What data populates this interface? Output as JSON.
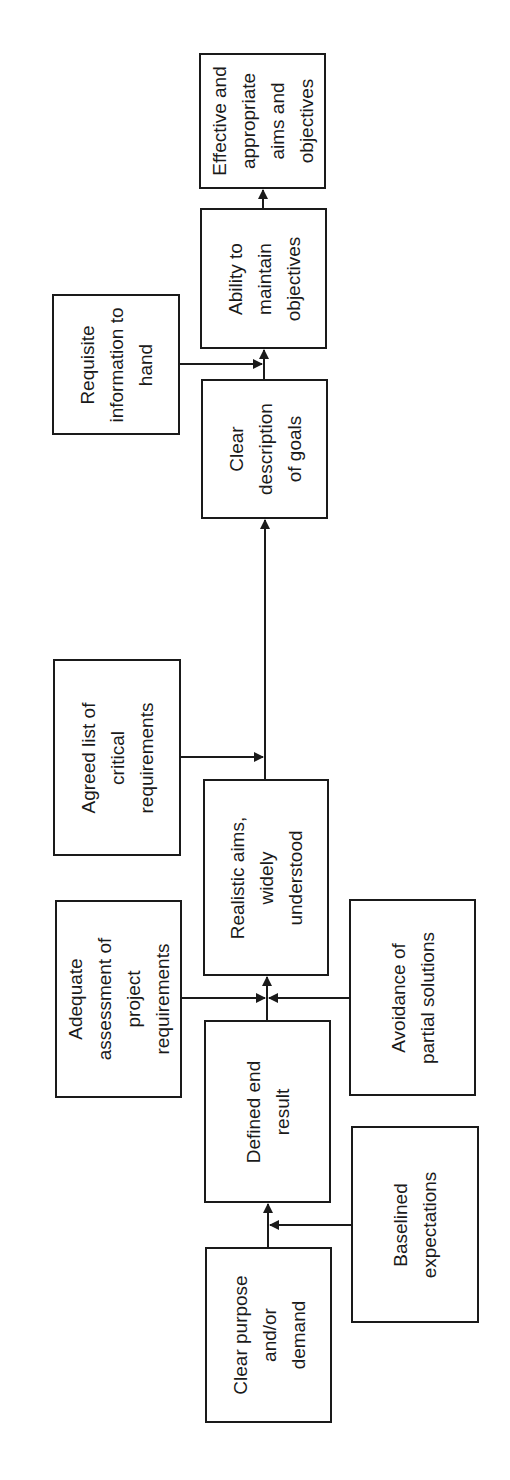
{
  "diagram": {
    "orientation": "rotated 90 degrees counter-clockwise; flow runs bottom to top",
    "nodes": [
      {
        "id": "effective",
        "label": "Effective and\nappropriate\naims and\nobjectives",
        "role": "outcome",
        "x": 199,
        "y": 53,
        "w": 127,
        "h": 136
      },
      {
        "id": "ability",
        "label": "Ability to\nmaintain\nobjectives",
        "role": "main",
        "x": 200,
        "y": 208,
        "w": 127,
        "h": 141
      },
      {
        "id": "requisite",
        "label": "Requisite\ninformation to\nhand",
        "role": "input",
        "x": 52,
        "y": 294,
        "w": 128,
        "h": 141
      },
      {
        "id": "clear_desc",
        "label": "Clear\ndescription\nof goals",
        "role": "main",
        "x": 201,
        "y": 379,
        "w": 127,
        "h": 140
      },
      {
        "id": "agreed",
        "label": "Agreed list of\ncritical\nrequirements",
        "role": "input",
        "x": 53,
        "y": 659,
        "w": 128,
        "h": 197
      },
      {
        "id": "realistic",
        "label": "Realistic aims,\nwidely\nunderstood",
        "role": "main",
        "x": 203,
        "y": 779,
        "w": 126,
        "h": 197
      },
      {
        "id": "adequate",
        "label": "Adequate\nassessment of\nproject\nrequirements",
        "role": "input",
        "x": 55,
        "y": 900,
        "w": 127,
        "h": 198
      },
      {
        "id": "avoidance",
        "label": "Avoidance of\npartial solutions",
        "role": "input",
        "x": 349,
        "y": 899,
        "w": 127,
        "h": 197
      },
      {
        "id": "defined",
        "label": "Defined end\nresult",
        "role": "main",
        "x": 204,
        "y": 1020,
        "w": 127,
        "h": 183
      },
      {
        "id": "baselined",
        "label": "Baselined\nexpectations",
        "role": "input",
        "x": 351,
        "y": 1126,
        "w": 128,
        "h": 197
      },
      {
        "id": "clear_purpose",
        "label": "Clear purpose\nand/or\ndemand",
        "role": "start",
        "x": 205,
        "y": 1247,
        "w": 127,
        "h": 176
      }
    ],
    "edges": [
      {
        "from": "clear_purpose",
        "to": "defined"
      },
      {
        "from": "baselined",
        "to": "defined"
      },
      {
        "from": "defined",
        "to": "realistic"
      },
      {
        "from": "adequate",
        "to": "realistic"
      },
      {
        "from": "avoidance",
        "to": "realistic"
      },
      {
        "from": "realistic",
        "to": "clear_desc"
      },
      {
        "from": "agreed",
        "to": "clear_desc"
      },
      {
        "from": "clear_desc",
        "to": "ability"
      },
      {
        "from": "requisite",
        "to": "ability"
      },
      {
        "from": "ability",
        "to": "effective"
      }
    ],
    "colors": {
      "stroke": "#1a1a1a",
      "background": "#ffffff"
    }
  }
}
